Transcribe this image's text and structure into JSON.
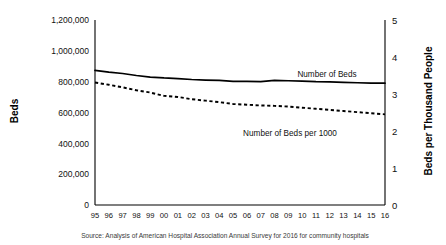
{
  "chart_data": {
    "type": "line",
    "title": "",
    "subtitle": "",
    "xlabel": "",
    "ylabel": "Beds",
    "y2label": "Beds per Thousand People",
    "grid": false,
    "legend_position": "inline-annotation",
    "x": [
      "95",
      "96",
      "97",
      "98",
      "99",
      "00",
      "01",
      "02",
      "03",
      "04",
      "05",
      "06",
      "07",
      "08",
      "09",
      "10",
      "11",
      "12",
      "13",
      "14",
      "15",
      "16"
    ],
    "xtick_labels": [
      "95",
      "96",
      "97",
      "98",
      "99",
      "00",
      "01",
      "02",
      "03",
      "04",
      "05",
      "06",
      "07",
      "08",
      "09",
      "10",
      "11",
      "12",
      "13",
      "14",
      "15",
      "16"
    ],
    "ytick_labels": [
      "0",
      "200,000",
      "400,000",
      "600,000",
      "800,000",
      "1,000,000",
      "1,200,000"
    ],
    "ytick_values": [
      0,
      200000,
      400000,
      600000,
      800000,
      1000000,
      1200000
    ],
    "ylim": [
      0,
      1200000
    ],
    "y2tick_labels": [
      "0",
      "1",
      "2",
      "3",
      "4",
      "5"
    ],
    "y2tick_values": [
      0,
      1,
      2,
      3,
      4,
      5
    ],
    "y2lim": [
      0,
      5
    ],
    "series": [
      {
        "name": "Number of Beds",
        "axis": "left",
        "style": "solid",
        "color": "#000000",
        "values": [
          873000,
          862000,
          853000,
          840000,
          830000,
          824000,
          820000,
          814000,
          810000,
          808000,
          802000,
          802000,
          800000,
          808000,
          806000,
          804000,
          800000,
          798000,
          795000,
          793000,
          791000,
          790000
        ]
      },
      {
        "name": "Number of Beds per 1000",
        "axis": "right",
        "style": "dashed",
        "color": "#000000",
        "values": [
          3.31,
          3.25,
          3.18,
          3.1,
          3.04,
          2.95,
          2.92,
          2.86,
          2.82,
          2.78,
          2.73,
          2.71,
          2.69,
          2.68,
          2.66,
          2.63,
          2.6,
          2.57,
          2.54,
          2.51,
          2.48,
          2.45
        ]
      }
    ],
    "annotations": [
      {
        "name": "Number of Beds",
        "text": "Number of Beds"
      },
      {
        "name": "Number of Beds per 1000",
        "text": "Number of Beds per 1000"
      }
    ],
    "source": "Source: Analysis of American Hospital Association Annual Survey for 2016 for community hospitals"
  }
}
